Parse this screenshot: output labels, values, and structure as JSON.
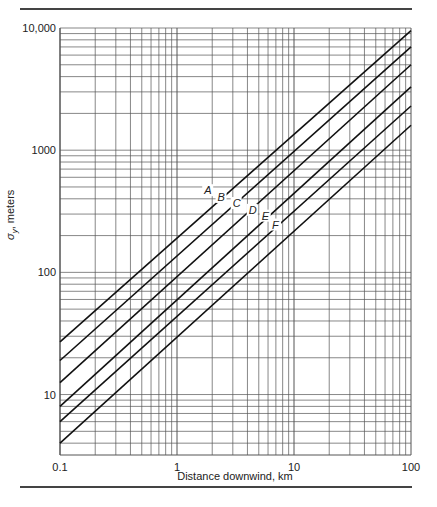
{
  "chart_data": {
    "type": "line",
    "title": "",
    "xlabel": "Distance downwind, km",
    "ylabel": "σy, meters",
    "xscale": "log",
    "yscale": "log",
    "xlim": [
      0.1,
      100
    ],
    "ylim": [
      3.2,
      10000
    ],
    "x_ticks": [
      "0.1",
      "1",
      "10",
      "100"
    ],
    "y_ticks": [
      "10",
      "100",
      "1000",
      "10,000"
    ],
    "grid": true,
    "legend": "inline curve labels",
    "x": [
      0.1,
      100
    ],
    "series": [
      {
        "name": "A",
        "values": [
          27,
          9500
        ],
        "label_at": [
          2.0,
          420
        ]
      },
      {
        "name": "B",
        "values": [
          19,
          7000
        ],
        "label_at": [
          2.6,
          370
        ]
      },
      {
        "name": "C",
        "values": [
          12.5,
          5000
        ],
        "label_at": [
          3.5,
          330
        ]
      },
      {
        "name": "D",
        "values": [
          8,
          3300
        ],
        "label_at": [
          4.8,
          290
        ]
      },
      {
        "name": "E",
        "values": [
          6,
          2300
        ],
        "label_at": [
          6.2,
          260
        ]
      },
      {
        "name": "F",
        "values": [
          4,
          1600
        ],
        "label_at": [
          7.6,
          220
        ]
      }
    ]
  },
  "axis": {
    "ylabel_main": "σ",
    "ylabel_sub": "y",
    "ylabel_rest": ", meters",
    "xlabel": "Distance downwind, km"
  }
}
